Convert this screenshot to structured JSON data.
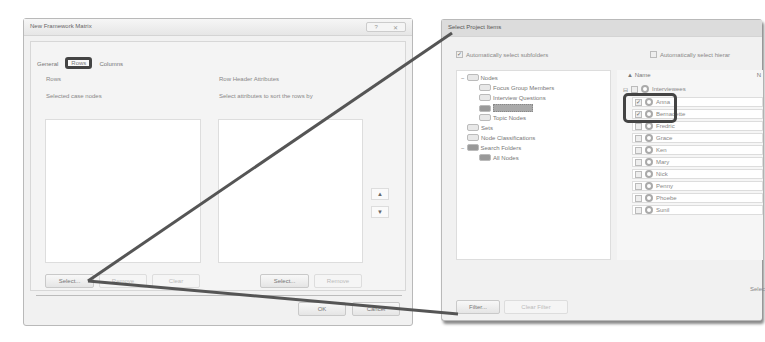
{
  "framework_dialog": {
    "title": "New Framework Matrix",
    "title_controls": [
      "?",
      "✕"
    ],
    "tabs": [
      {
        "label": "General",
        "active": false
      },
      {
        "label": "Rows",
        "active": true
      },
      {
        "label": "Columns",
        "active": false
      }
    ],
    "section_label": "Rows",
    "left_panel": {
      "label": "Selected case nodes",
      "buttons": {
        "select": "Select...",
        "remove": "Remove",
        "clear": "Clear"
      }
    },
    "right_panel": {
      "header": "Row Header Attributes",
      "label": "Select attributes to sort the rows by",
      "buttons": {
        "select": "Select...",
        "remove": "Remove"
      },
      "move_up": "▲",
      "move_down": "▼"
    },
    "footer": {
      "ok": "OK",
      "cancel": "Cancel"
    }
  },
  "select_dialog": {
    "title": "Select Project Items",
    "auto_subfolders": {
      "label": "Automatically select subfolders",
      "checked": true
    },
    "auto_hierarchy": {
      "label": "Automatically select hierar",
      "checked": false
    },
    "tree": [
      {
        "label": "Nodes",
        "level": 0,
        "expander": "−"
      },
      {
        "label": "Focus Group Members",
        "level": 1
      },
      {
        "label": "Interview Questions",
        "level": 1
      },
      {
        "label": "Interviewees",
        "level": 1,
        "selected": true
      },
      {
        "label": "Topic Nodes",
        "level": 1
      },
      {
        "label": "Sets",
        "level": 0
      },
      {
        "label": "Node Classifications",
        "level": 0
      },
      {
        "label": "Search Folders",
        "level": 0,
        "expander": "−"
      },
      {
        "label": "All Nodes",
        "level": 1
      }
    ],
    "list": {
      "column_header": "Name",
      "column_header_2": "N",
      "parent": "Interviewees",
      "items": [
        {
          "label": "Anna",
          "checked": true
        },
        {
          "label": "Bernadette",
          "checked": true
        },
        {
          "label": "Fredric",
          "checked": false
        },
        {
          "label": "Grace",
          "checked": false
        },
        {
          "label": "Ken",
          "checked": false
        },
        {
          "label": "Mary",
          "checked": false
        },
        {
          "label": "Nick",
          "checked": false
        },
        {
          "label": "Penny",
          "checked": false
        },
        {
          "label": "Phoebe",
          "checked": false
        },
        {
          "label": "Sunil",
          "checked": false
        }
      ]
    },
    "status_text": "Selec",
    "buttons": {
      "filter": "Filter...",
      "clear_filter": "Clear Filter"
    }
  }
}
